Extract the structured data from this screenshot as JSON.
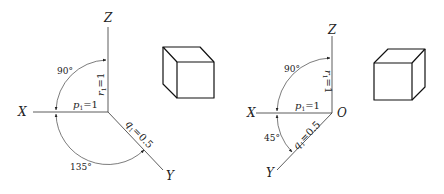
{
  "figures": [
    {
      "name": "oblique-cavalier-left",
      "axes": {
        "z": "Z",
        "x": "X",
        "y": "Y"
      },
      "labels": {
        "r": "r",
        "r_sub": "1",
        "r_val": "=1",
        "p": "p",
        "p_sub": "1",
        "p_val": "=1",
        "q": "q",
        "q_sub": "1",
        "q_val": "=0.5"
      },
      "angles": {
        "top": "90°",
        "bottom": "135°"
      }
    },
    {
      "name": "oblique-cabinet-right",
      "axes": {
        "z": "Z",
        "x": "X",
        "y": "Y",
        "origin": "O"
      },
      "labels": {
        "r": "r",
        "r_sub": "1",
        "r_val": "=1",
        "p": "p",
        "p_sub": "1",
        "p_val": "=1",
        "q": "q",
        "q_sub": "1",
        "q_val": "=0.5"
      },
      "angles": {
        "top": "90°",
        "bottom": "45°"
      }
    }
  ],
  "colors": {
    "stroke": "#222222",
    "background": "#ffffff"
  }
}
